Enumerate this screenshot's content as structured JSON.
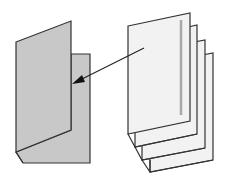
{
  "diagram": {
    "colors": {
      "background": "#ffffff",
      "folded_sheet_fill": "#c8c8c8",
      "page_fill": "#f2f2f2",
      "outline": "#333333",
      "spine_mark": "#a8a8a8"
    },
    "folded_sheet": {
      "label": ""
    },
    "page_stack": {
      "page_count": 4
    },
    "arrow": {
      "direction": "from-stack-to-folded-sheet"
    }
  }
}
